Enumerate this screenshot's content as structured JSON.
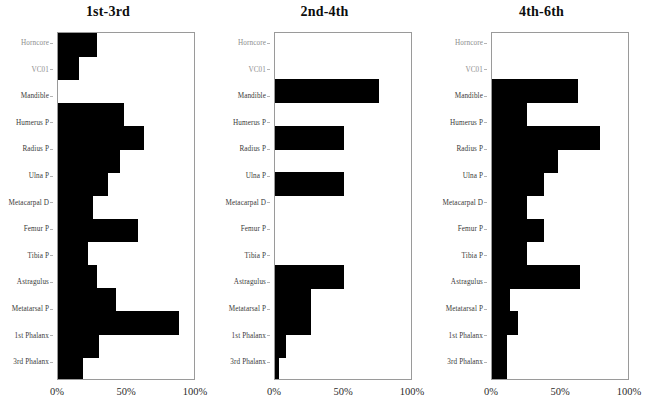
{
  "figure": {
    "type": "multi-panel-horizontal-bar",
    "panel_count": 3,
    "categories": [
      "Horncore",
      "VC01",
      "Mandible",
      "Humerus P",
      "Radius P",
      "Ulna P",
      "Metacarpal D",
      "Femur P",
      "Tibia P",
      "Astragulus",
      "Metatarsal P",
      "1st Phalanx",
      "3rd Phalanx"
    ],
    "faint_categories": [
      "Horncore",
      "VC01"
    ],
    "xticks": [
      "0%",
      "50%",
      "100%"
    ],
    "xtick_values": [
      0,
      50,
      100
    ],
    "xlim": [
      0,
      100
    ],
    "bar_color": "#000000",
    "frame_color": "#9a9a9a"
  },
  "panels": [
    {
      "title": "1st-3rd",
      "chart_data": {
        "type": "bar",
        "orientation": "horizontal",
        "title": "1st-3rd",
        "xlabel": "",
        "ylabel": "",
        "xlim": [
          0,
          100
        ],
        "grid": false,
        "legend": "none",
        "categories": [
          "Horncore",
          "VC01",
          "Mandible",
          "Humerus P",
          "Radius P",
          "Ulna P",
          "Metacarpal D",
          "Femur P",
          "Tibia P",
          "Astragulus",
          "Metatarsal P",
          "1st Phalanx",
          "3rd Phalanx"
        ],
        "values": [
          28,
          15,
          0,
          48,
          62,
          45,
          36,
          25,
          58,
          22,
          28,
          42,
          88,
          30,
          18
        ]
      }
    },
    {
      "title": "2nd-4th",
      "chart_data": {
        "type": "bar",
        "orientation": "horizontal",
        "title": "2nd-4th",
        "xlabel": "",
        "ylabel": "",
        "xlim": [
          0,
          100
        ],
        "grid": false,
        "legend": "none",
        "categories": [
          "Horncore",
          "VC01",
          "Mandible",
          "Humerus P",
          "Radius P",
          "Ulna P",
          "Metacarpal D",
          "Femur P",
          "Tibia P",
          "Astragulus",
          "Metatarsal P",
          "1st Phalanx",
          "3rd Phalanx"
        ],
        "values": [
          0,
          0,
          75,
          0,
          50,
          0,
          50,
          0,
          0,
          0,
          50,
          26,
          26,
          8,
          3
        ]
      }
    },
    {
      "title": "4th-6th",
      "chart_data": {
        "type": "bar",
        "orientation": "horizontal",
        "title": "4th-6th",
        "xlabel": "",
        "ylabel": "",
        "xlim": [
          0,
          100
        ],
        "grid": false,
        "legend": "none",
        "categories": [
          "Horncore",
          "VC01",
          "Mandible",
          "Humerus P",
          "Radius P",
          "Ulna P",
          "Metacarpal D",
          "Femur P",
          "Tibia P",
          "Astragulus",
          "Metatarsal P",
          "1st Phalanx",
          "3rd Phalanx"
        ],
        "values": [
          0,
          0,
          62,
          25,
          78,
          48,
          38,
          25,
          38,
          25,
          64,
          13,
          19,
          11,
          11
        ]
      }
    }
  ]
}
